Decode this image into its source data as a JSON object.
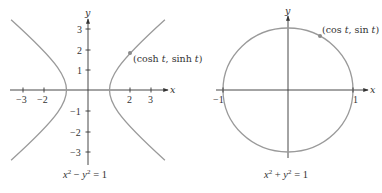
{
  "hyperbola_panel": {
    "equation_caption": {
      "lhs_a": "x",
      "sup_a": "2",
      "minus": " − ",
      "lhs_b": "y",
      "sup_b": "2",
      "rhs": " = 1"
    },
    "point_label": "(cosh t, sinh t)",
    "point_label_parts": {
      "open": "(cosh ",
      "t1": "t",
      "mid": ", sinh ",
      "t2": "t",
      "close": ")"
    },
    "x_axis_label": "x",
    "y_axis_label": "y",
    "x_ticks": [
      "−3",
      "−2",
      "2",
      "3"
    ],
    "y_ticks": [
      "3",
      "2",
      "1",
      "−1",
      "−2",
      "−3"
    ]
  },
  "circle_panel": {
    "equation_caption": {
      "lhs_a": "x",
      "sup_a": "2",
      "plus": " + ",
      "lhs_b": "y",
      "sup_b": "2",
      "rhs": " = 1"
    },
    "point_label_parts": {
      "open": "(cos ",
      "t1": "t",
      "mid": ", sin ",
      "t2": "t",
      "close": ")"
    },
    "point_label": "(cos t, sin t)",
    "x_axis_label": "x",
    "y_axis_label": "y",
    "x_ticks": [
      "−1",
      "1"
    ]
  },
  "colors": {
    "curve": "#9a9a9a",
    "axis": "#333333",
    "point": "#8a8a8a"
  }
}
